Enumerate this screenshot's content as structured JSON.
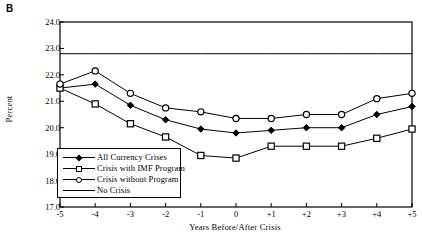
{
  "panel_label": "B",
  "chart_data": {
    "type": "line",
    "title": "",
    "xlabel": "Years Before/After Crisis",
    "ylabel": "Percent",
    "x": [
      -5,
      -4,
      -3,
      -2,
      -1,
      0,
      1,
      2,
      3,
      4,
      5
    ],
    "xtick_labels": [
      "-5",
      "-4",
      "-3",
      "-2",
      "-1",
      "0",
      "+1",
      "+2",
      "+3",
      "+4",
      "+5"
    ],
    "ytick_labels": [
      "24.0",
      "23.0",
      "22.0",
      "21.0",
      "20.0",
      "19.0",
      "18.0",
      "17.0"
    ],
    "ytick_values": [
      24.0,
      23.0,
      22.0,
      21.0,
      20.0,
      19.0,
      18.0,
      17.0
    ],
    "xlim": [
      -5,
      5
    ],
    "ylim": [
      17.0,
      24.0
    ],
    "grid": false,
    "legend_position": "lower-left-inside",
    "series": [
      {
        "name": "All Currency Crises",
        "marker": "filled-diamond",
        "values": [
          21.5,
          21.65,
          20.85,
          20.3,
          19.95,
          19.8,
          19.9,
          20.0,
          20.0,
          20.5,
          20.8
        ]
      },
      {
        "name": "Crisis with IMF Program",
        "marker": "open-square",
        "values": [
          21.5,
          20.9,
          20.15,
          19.65,
          18.95,
          18.85,
          19.3,
          19.3,
          19.3,
          19.6,
          19.95
        ]
      },
      {
        "name": "Crisis without Program",
        "marker": "open-circle",
        "values": [
          21.65,
          22.15,
          21.3,
          20.75,
          20.6,
          20.35,
          20.35,
          20.5,
          20.5,
          21.1,
          21.3
        ]
      },
      {
        "name": "No Crisis",
        "marker": "none",
        "constant": 22.8,
        "values": [
          22.8,
          22.8,
          22.8,
          22.8,
          22.8,
          22.8,
          22.8,
          22.8,
          22.8,
          22.8,
          22.8
        ]
      }
    ],
    "colors": {
      "axis": "#000000",
      "series_line": "#000000",
      "background": "#ffffff"
    }
  }
}
